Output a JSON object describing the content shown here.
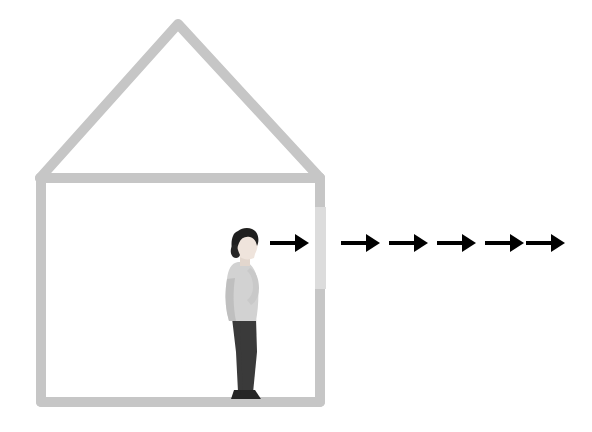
{
  "illustration": {
    "title": "Person leaving a house",
    "description": "Minimal line illustration of a house outline with a person standing inside in profile near an opening in the right wall, and a row of arrows pointing right and away from the house.",
    "background_color": "#ffffff"
  },
  "colors": {
    "wall": "#c6c6c6",
    "wall_opening": "#dcdcdc",
    "arrow": "#000000",
    "hair": "#1f1f1f",
    "skin": "#efe4dc",
    "top": "#d2d2d2",
    "top_shade": "#bfbfbf",
    "pants": "#3a3a3a",
    "shoes": "#262626"
  },
  "house": {
    "label": "House outline",
    "stroke_width": 10,
    "roof_peak": {
      "x": 178,
      "y": 24
    },
    "left_eave": {
      "x": 40,
      "y": 178
    },
    "right_eave": {
      "x": 320,
      "y": 178
    },
    "floor_y": 402,
    "left_wall_x": 41,
    "right_wall_x": 320,
    "opening": {
      "label": "Doorway opening in right wall",
      "x": 315,
      "y": 207,
      "width": 11,
      "height": 82
    }
  },
  "person": {
    "label": "Person standing in profile facing right",
    "facing": "right",
    "bounds": {
      "x": 222,
      "y": 231,
      "width": 40,
      "height": 170
    },
    "ground_y": 400
  },
  "arrows": {
    "label": "Arrows indicating outward movement",
    "count": 6,
    "direction": "right",
    "y": 243,
    "shaft_thickness": 4,
    "items": [
      {
        "name": "arrow-1-inside",
        "x1": 270,
        "x2": 309,
        "length": 39
      },
      {
        "name": "arrow-2",
        "x1": 341,
        "x2": 380,
        "length": 39
      },
      {
        "name": "arrow-3",
        "x1": 389,
        "x2": 428,
        "length": 39
      },
      {
        "name": "arrow-4",
        "x1": 437,
        "x2": 476,
        "length": 39
      },
      {
        "name": "arrow-5",
        "x1": 485,
        "x2": 524,
        "length": 39
      },
      {
        "name": "arrow-6",
        "x1": 526,
        "x2": 565,
        "length": 39
      }
    ]
  }
}
